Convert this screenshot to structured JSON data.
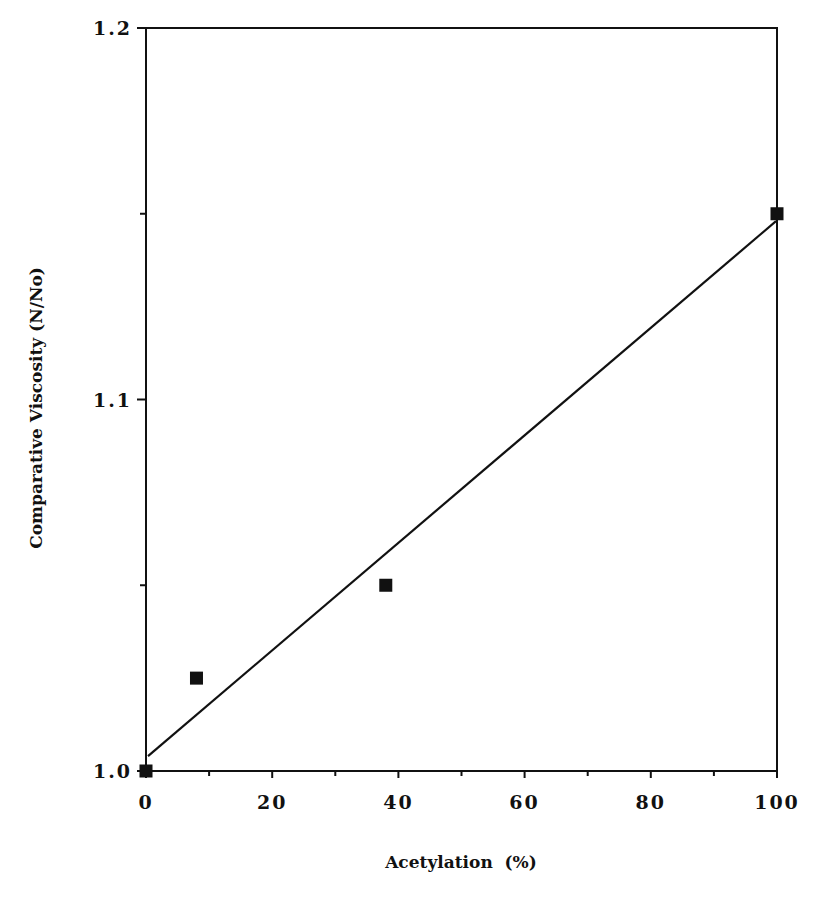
{
  "chart_data": {
    "type": "scatter",
    "title": "",
    "xlabel": "Acetylation  (%)",
    "ylabel": "Comparative Viscosity (N/No)",
    "xlim": [
      0,
      100
    ],
    "ylim": [
      1.0,
      1.2
    ],
    "x_ticks": [
      0,
      20,
      40,
      60,
      80,
      100
    ],
    "x_tick_labels": [
      "0",
      "20",
      "40",
      "60",
      "80",
      "100"
    ],
    "x_minor_ticks": [
      10,
      30,
      50,
      70,
      90
    ],
    "y_ticks": [
      1.0,
      1.1,
      1.2
    ],
    "y_tick_labels": [
      "1.0",
      "1.1",
      "1.2"
    ],
    "y_minor_ticks": [
      1.05,
      1.15
    ],
    "grid": false,
    "legend": null,
    "series": [
      {
        "name": "measured",
        "marker": "square",
        "color": "#111111",
        "x": [
          0,
          8,
          38,
          100
        ],
        "y": [
          1.0,
          1.025,
          1.05,
          1.15
        ]
      },
      {
        "name": "linear fit",
        "style": "line",
        "color": "#111111",
        "x": [
          0,
          100
        ],
        "y": [
          1.004,
          1.148
        ]
      }
    ]
  },
  "layout": {
    "plot_left": 146,
    "plot_right": 777,
    "plot_top": 28,
    "plot_bottom": 771
  }
}
